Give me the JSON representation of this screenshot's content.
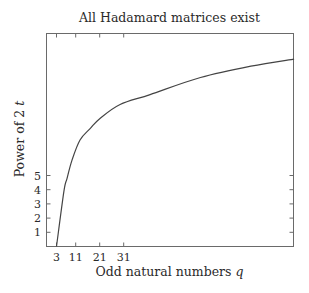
{
  "chart_data": {
    "type": "line",
    "title": "All Hadamard matrices exist",
    "xlabel": "Odd natural numbers q",
    "ylabel": "Power of 2 t",
    "x_ticks": [
      3,
      11,
      21,
      31
    ],
    "y_ticks": [
      1,
      2,
      3,
      4,
      5
    ],
    "xlim": [
      0.5,
      102
    ],
    "ylim": [
      0,
      15
    ],
    "grid": false,
    "legend": null,
    "series": [
      {
        "name": "boundary",
        "x": [
          3,
          6.1,
          7.4,
          9.5,
          12.8,
          17,
          21,
          29.5,
          42,
          63,
          84,
          102
        ],
        "y": [
          0,
          3.9,
          4.8,
          6.1,
          7.5,
          8.3,
          9.0,
          10.0,
          10.7,
          11.9,
          12.7,
          13.2
        ]
      }
    ]
  },
  "labels": {
    "title": "All Hadamard matrices exist",
    "xlabel_text": "Odd natural numbers ",
    "xlabel_var": "q",
    "ylabel_text": "Power of 2 ",
    "ylabel_var": "t"
  }
}
